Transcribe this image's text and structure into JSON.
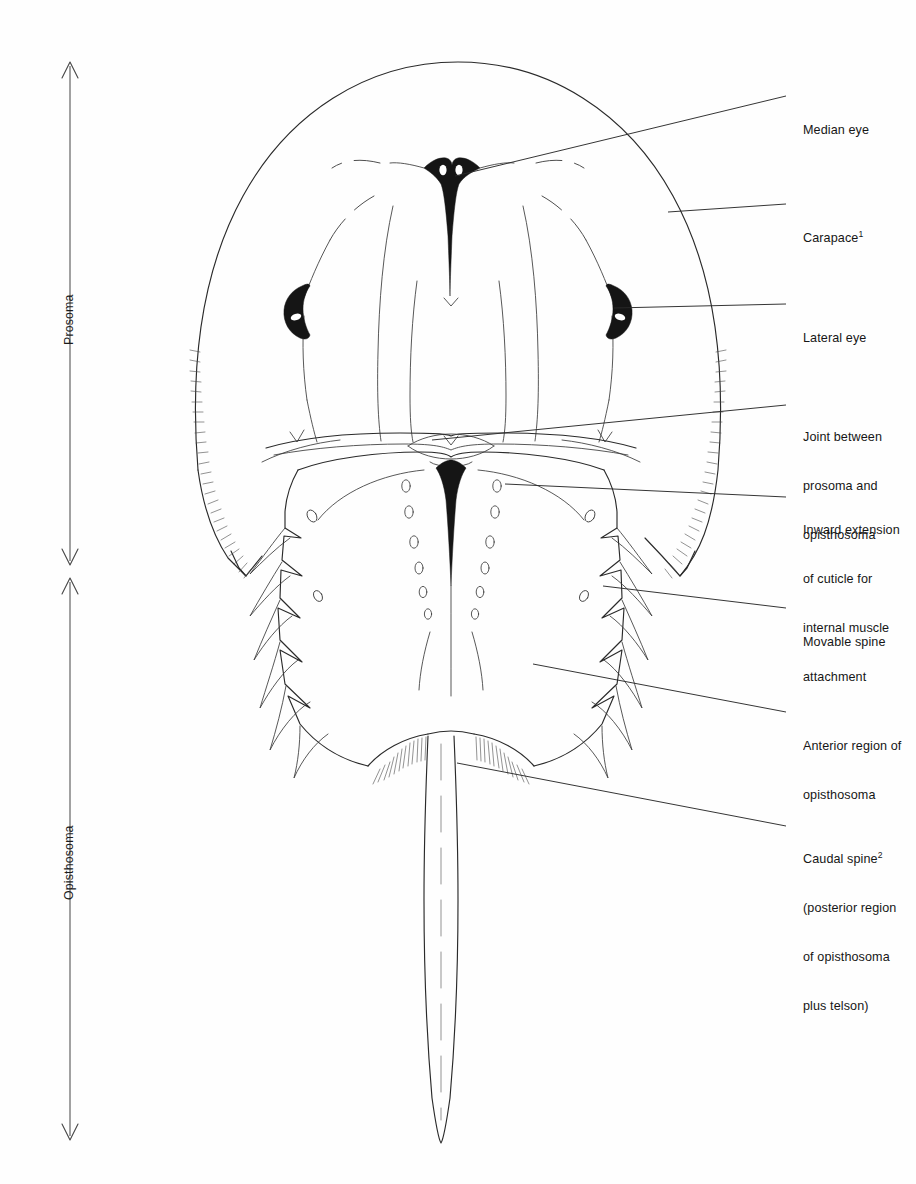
{
  "figure": {
    "background_color": "#fefefe",
    "ink_color": "#1a1a1a"
  },
  "body_regions": [
    {
      "id": "prosoma",
      "label": "Prosoma",
      "axis_top_y": 62,
      "axis_bottom_y": 565
    },
    {
      "id": "opisthosoma",
      "label": "Opisthosoma",
      "axis_top_y": 578,
      "axis_bottom_y": 1140
    }
  ],
  "callouts": [
    {
      "id": "median-eye",
      "lines": [
        "Median eye"
      ],
      "text_x": 803,
      "text_y": 89,
      "leader_x1": 786,
      "leader_y1": 96,
      "leader_x2": 455,
      "leader_y2": 176
    },
    {
      "id": "carapace",
      "lines": [
        "Carapace"
      ],
      "superscript": "1",
      "text_x": 803,
      "text_y": 197,
      "leader_x1": 786,
      "leader_y1": 204,
      "leader_x2": 668,
      "leader_y2": 212
    },
    {
      "id": "lateral-eye",
      "lines": [
        "Lateral eye"
      ],
      "text_x": 803,
      "text_y": 297,
      "leader_x1": 786,
      "leader_y1": 304,
      "leader_x2": 614,
      "leader_y2": 308
    },
    {
      "id": "prosoma-opisthosoma-joint",
      "lines": [
        "Joint between",
        "prosoma and",
        "opisthosoma"
      ],
      "text_x": 803,
      "text_y": 396,
      "leader_x1": 786,
      "leader_y1": 405,
      "leader_x2": 432,
      "leader_y2": 440
    },
    {
      "id": "inward-cuticle-extension",
      "lines": [
        "Inward extension",
        "of cuticle for",
        "internal muscle",
        "attachment"
      ],
      "text_x": 803,
      "text_y": 489,
      "leader_x1": 786,
      "leader_y1": 497,
      "leader_x2": 505,
      "leader_y2": 484
    },
    {
      "id": "movable-spine",
      "lines": [
        "Movable spine"
      ],
      "text_x": 803,
      "text_y": 601,
      "leader_x1": 786,
      "leader_y1": 608,
      "leader_x2": 603,
      "leader_y2": 586
    },
    {
      "id": "anterior-region-opisthosoma",
      "lines": [
        "Anterior region of",
        "opisthosoma"
      ],
      "text_x": 803,
      "text_y": 705,
      "leader_x1": 786,
      "leader_y1": 712,
      "leader_x2": 533,
      "leader_y2": 664
    },
    {
      "id": "caudal-spine",
      "lines": [
        "Caudal spine",
        "(posterior region",
        "of opisthosoma",
        "plus telson)"
      ],
      "superscript": "2",
      "superscript_line": 0,
      "text_x": 803,
      "text_y": 818,
      "leader_x1": 786,
      "leader_y1": 826,
      "leader_x2": 457,
      "leader_y2": 763
    }
  ],
  "anatomy_features": {
    "median_eye": {
      "x": 451,
      "y": 172,
      "description": "dark wedge with two white ocelli"
    },
    "lateral_eye_left": {
      "x": 300,
      "y": 308,
      "description": "crescent with white slit"
    },
    "lateral_eye_right": {
      "x": 605,
      "y": 308,
      "description": "crescent with white slit"
    },
    "apodeme_dot_pairs": 6,
    "movable_spines_per_side": 6,
    "telson_tip_y": 1143
  }
}
